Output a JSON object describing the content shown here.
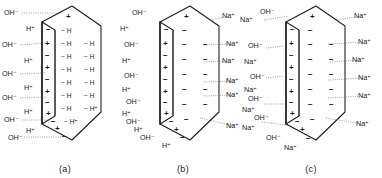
{
  "figure": {
    "type": "scientific-diagram",
    "panels": [
      {
        "id": "a",
        "caption": "(a)",
        "left_labels": [
          "OH⁻",
          "H⁺",
          "OH⁻",
          "H⁺",
          "OH⁻",
          "H⁺",
          "OH⁻",
          "H⁺",
          "OH⁻",
          "H⁺",
          "OH⁻"
        ],
        "right_labels": [],
        "channel_signs": [
          "+",
          "−",
          "+",
          "−",
          "+",
          "−",
          "+",
          "−",
          "+",
          "−",
          "+",
          "−",
          "+",
          "−"
        ],
        "interior_symbols": [
          "− H",
          "− H",
          "− H",
          "− H",
          "− H",
          "− H",
          "− H",
          "− H",
          "− H",
          "− H",
          "− H",
          "− H",
          "− H⁺"
        ],
        "interior_note": "H"
      },
      {
        "id": "b",
        "caption": "(b)",
        "left_labels": [
          "OH⁻",
          "H⁺",
          "OH⁻",
          "H⁺",
          "OH⁻",
          "H⁺",
          "OH⁻",
          "H⁺",
          "OH⁻",
          "H⁺",
          "OH⁻",
          "H⁺"
        ],
        "right_labels": [
          "Na⁺",
          "Na⁺",
          "Na⁺",
          "Na⁺",
          "Na⁺",
          "Na⁺"
        ],
        "channel_signs": [
          "+",
          "−",
          "+",
          "−",
          "+",
          "−",
          "+",
          "−",
          "+",
          "−",
          "+",
          "−",
          "+",
          "−"
        ],
        "interior_symbols": [
          "−",
          "−",
          "−",
          "−",
          "−",
          "−",
          "−",
          "−",
          "−",
          "−",
          "−",
          "−"
        ],
        "interior_note": ""
      },
      {
        "id": "c",
        "caption": "(c)",
        "left_labels": [
          "OH⁻",
          "Na⁺",
          "OH⁻",
          "Na⁺",
          "OH⁻",
          "Na⁺",
          "OH⁻",
          "Na⁺",
          "OH⁻",
          "Na⁺",
          "OH",
          "Na⁺",
          "OH⁻",
          "Na⁺"
        ],
        "right_labels": [
          "Na⁺",
          "Na⁺",
          "Na⁺",
          "Na⁺",
          "Na⁺",
          "Na⁺"
        ],
        "channel_signs": [
          "+",
          "−",
          "+",
          "−",
          "+",
          "−",
          "+",
          "−",
          "+",
          "−",
          "+",
          "−",
          "+",
          "−"
        ],
        "interior_symbols": [
          "−",
          "−",
          "−",
          "−",
          "−",
          "−",
          "−",
          "−",
          "−",
          "−",
          "−",
          "−"
        ],
        "interior_note": ""
      }
    ],
    "ion_species": {
      "hydroxide": "OH⁻",
      "proton": "H⁺",
      "sodium": "Na⁺",
      "hydrogen": "H"
    },
    "signs": {
      "positive": "+",
      "negative": "−"
    },
    "colors": {
      "ink": "#1a1a1a",
      "leader": "#555555",
      "background": "#ffffff"
    }
  }
}
